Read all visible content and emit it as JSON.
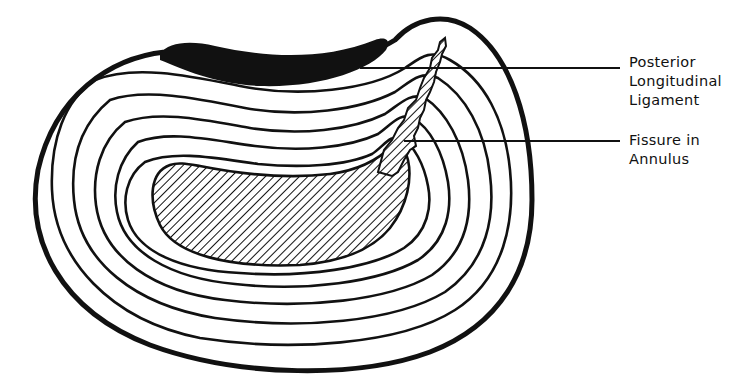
{
  "diagram": {
    "colors": {
      "ink": "#111111",
      "background": "#ffffff"
    },
    "labels": [
      {
        "id": "posterior-longitudinal-ligament",
        "lines": [
          "Posterior",
          "Longitudinal",
          "Ligament"
        ]
      },
      {
        "id": "fissure-in-annulus",
        "lines": [
          "Fissure in",
          "Annulus"
        ]
      }
    ],
    "structures": {
      "annulus_ring_count": 6,
      "nucleus": "hatched",
      "ligament": "solid black band on posterior margin",
      "fissure": "hatched radial tear from nucleus to posterior margin"
    }
  }
}
